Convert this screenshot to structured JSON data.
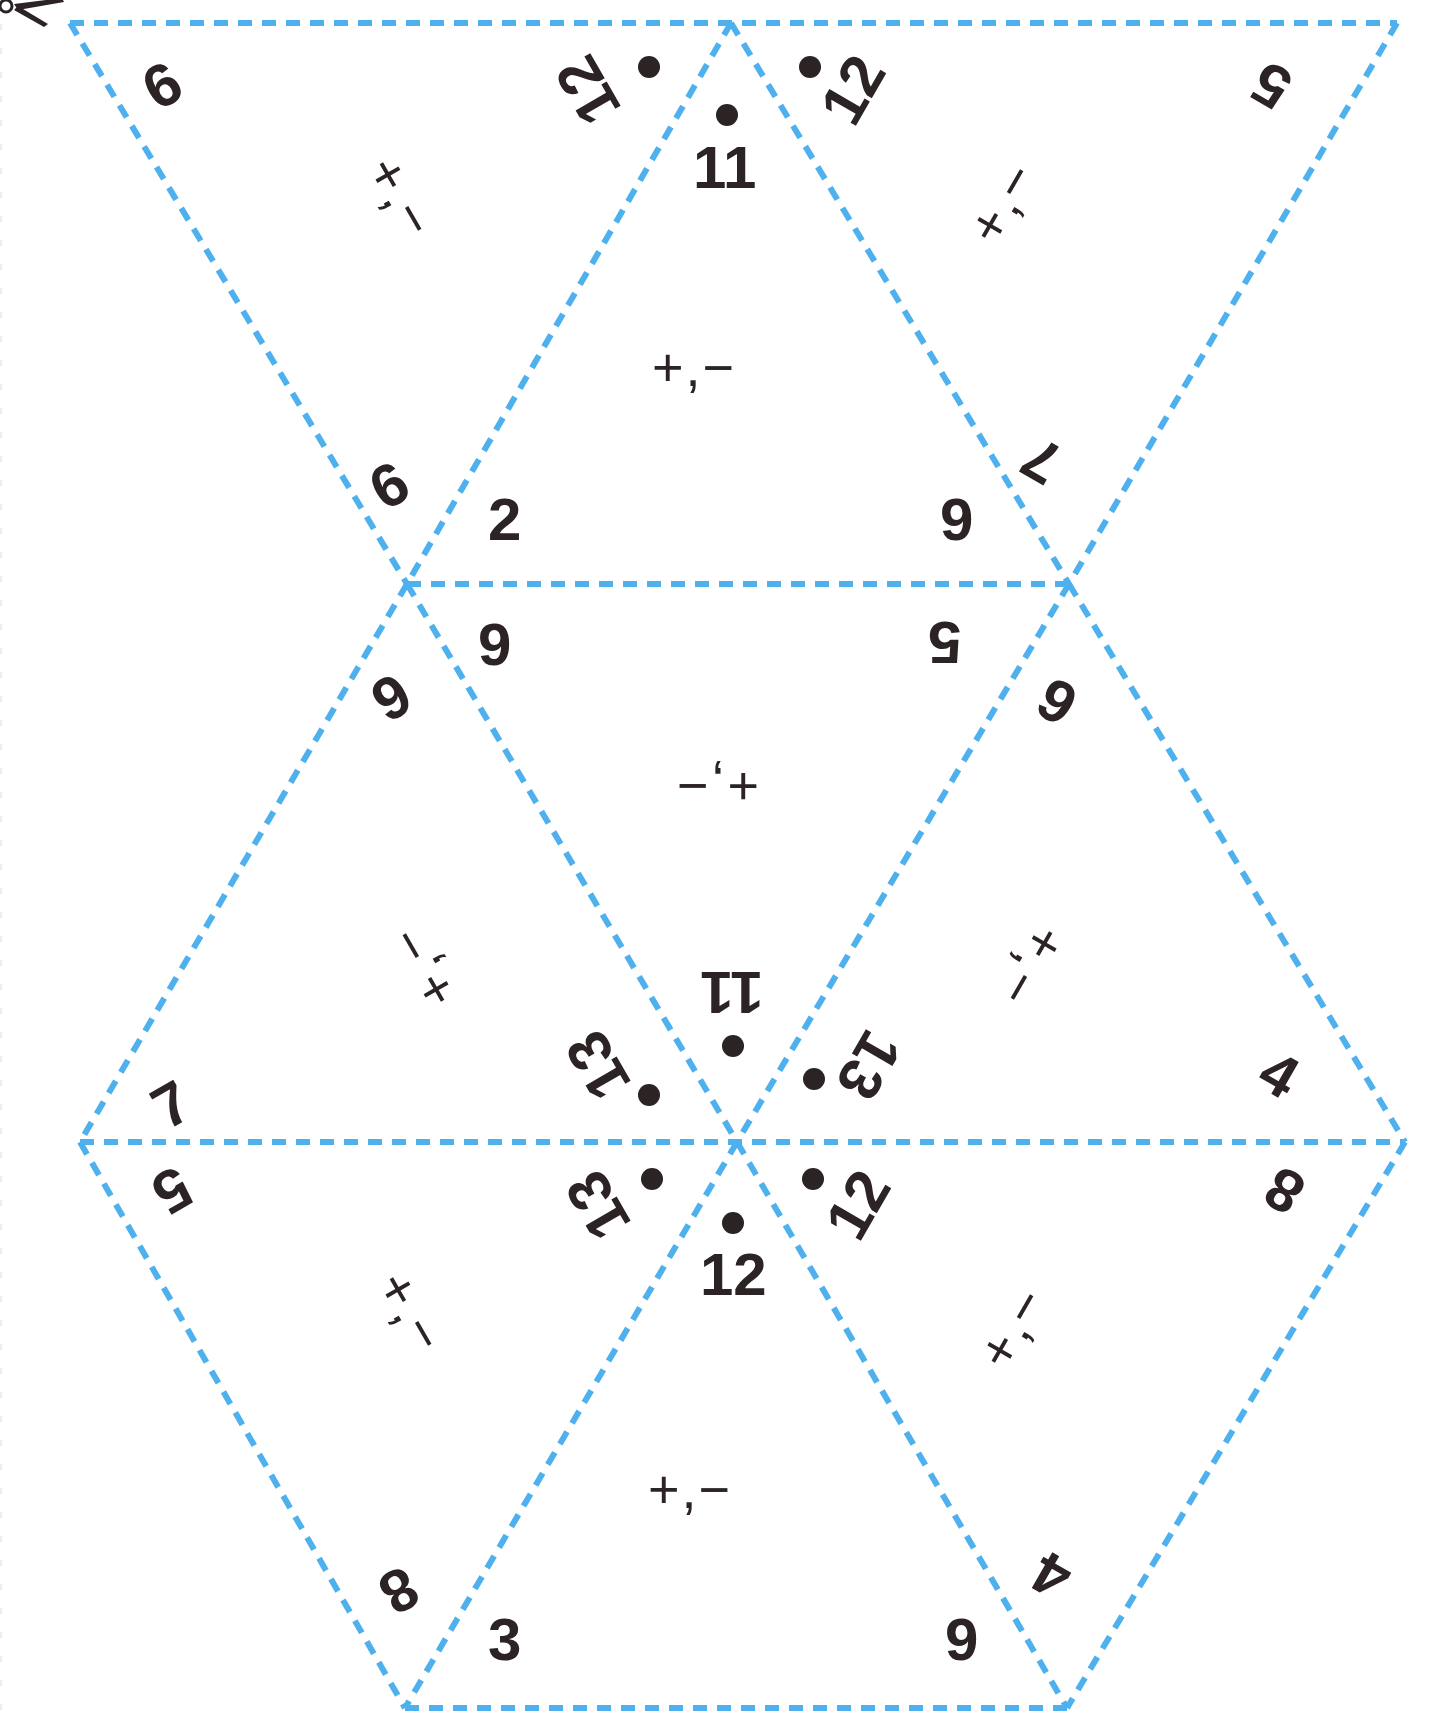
{
  "sheet": {
    "title": "Triangle puzzle cut-out sheet",
    "line_color": "#4fb0ee",
    "ink_color": "#2b2324",
    "scissors_icon": "scissors-icon"
  },
  "vertices": {
    "row0_y": 23,
    "row1_y": 584,
    "row2_y": 1142,
    "row3_y": 1708
  },
  "triangles": [
    {
      "id": "t1",
      "labels": [
        {
          "text": "9",
          "note": "rotated"
        },
        {
          "text": "12"
        },
        {
          "text": "9"
        },
        {
          "text": "+,−"
        }
      ]
    },
    {
      "id": "t2",
      "labels": [
        {
          "text": "11"
        },
        {
          "text": "2"
        },
        {
          "text": "9"
        },
        {
          "text": "+,−"
        }
      ]
    },
    {
      "id": "t3",
      "labels": [
        {
          "text": "12"
        },
        {
          "text": "5"
        },
        {
          "text": "7"
        },
        {
          "text": "+,−"
        }
      ]
    },
    {
      "id": "t4",
      "labels": [
        {
          "text": "9"
        },
        {
          "text": "5"
        },
        {
          "text": "11"
        },
        {
          "text": "+,−"
        }
      ]
    },
    {
      "id": "t5",
      "labels": [
        {
          "text": "9"
        },
        {
          "text": "7"
        },
        {
          "text": "13"
        },
        {
          "text": "+,−"
        }
      ]
    },
    {
      "id": "t6",
      "labels": [
        {
          "text": "9"
        },
        {
          "text": "4"
        },
        {
          "text": "13"
        },
        {
          "text": "+,−"
        }
      ]
    },
    {
      "id": "t7",
      "labels": [
        {
          "text": "5"
        },
        {
          "text": "13"
        },
        {
          "text": "8"
        },
        {
          "text": "+,−"
        }
      ]
    },
    {
      "id": "t8",
      "labels": [
        {
          "text": "12"
        },
        {
          "text": "3"
        },
        {
          "text": "9"
        },
        {
          "text": "+,−"
        }
      ]
    },
    {
      "id": "t9",
      "labels": [
        {
          "text": "12"
        },
        {
          "text": "8"
        },
        {
          "text": "4"
        },
        {
          "text": "+,−"
        }
      ]
    }
  ],
  "labels": {
    "t1_a": "9",
    "t1_b": "12",
    "t1_c": "9",
    "t1_ops": "+,−",
    "t2_a": "11",
    "t2_b": "2",
    "t2_c": "9",
    "t2_ops": "+,−",
    "t3_a": "12",
    "t3_b": "5",
    "t3_c": "7",
    "t3_ops": "+,−",
    "t4_a": "9",
    "t4_b": "5",
    "t4_c": "11",
    "t4_ops": "+,−",
    "t5_a": "9",
    "t5_b": "7",
    "t5_c": "13",
    "t5_ops": "+,−",
    "t6_a": "9",
    "t6_b": "4",
    "t6_c": "13",
    "t6_ops": "+,−",
    "t7_a": "5",
    "t7_b": "13",
    "t7_c": "8",
    "t7_ops": "+,−",
    "t8_a": "12",
    "t8_b": "3",
    "t8_c": "9",
    "t8_ops": "+,−",
    "t9_a": "12",
    "t9_b": "8",
    "t9_c": "4",
    "t9_ops": "+,−"
  }
}
